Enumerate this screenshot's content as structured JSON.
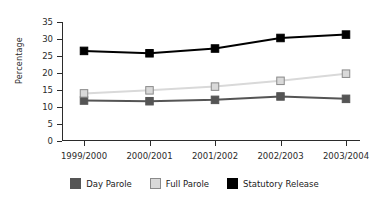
{
  "chart_data": {
    "type": "line",
    "title": "",
    "xlabel": "",
    "ylabel": "Percentage",
    "categories": [
      "1999/2000",
      "2000/2001",
      "2001/2002",
      "2002/2003",
      "2003/2004"
    ],
    "ylim": [
      0,
      35
    ],
    "yticks": [
      0,
      5,
      10,
      15,
      20,
      25,
      30,
      35
    ],
    "grid": false,
    "legend_position": "bottom",
    "series": [
      {
        "name": "Day Parole",
        "color": "#555555",
        "marker": "square",
        "values": [
          11.9,
          11.7,
          12.1,
          13.1,
          12.4
        ]
      },
      {
        "name": "Full Parole",
        "color": "#d9d9d9",
        "marker": "square",
        "values": [
          14.0,
          14.9,
          16.0,
          17.7,
          19.8
        ]
      },
      {
        "name": "Statutory Release",
        "color": "#000000",
        "marker": "square",
        "values": [
          26.5,
          25.8,
          27.2,
          30.3,
          31.3
        ]
      }
    ]
  }
}
